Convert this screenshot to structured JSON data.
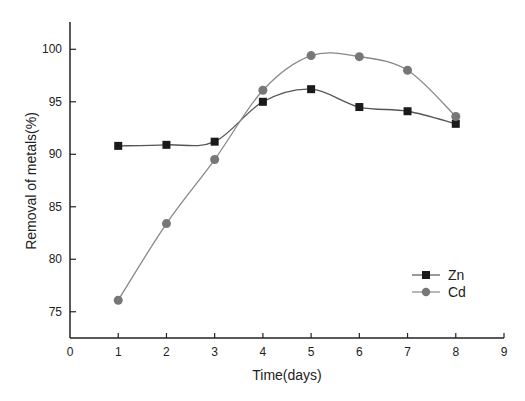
{
  "chart_data": {
    "type": "line",
    "title": "",
    "xlabel": "Time(days)",
    "ylabel": "Removal of metals(%)",
    "xlim": [
      0,
      9
    ],
    "ylim": [
      72.5,
      102.6
    ],
    "x_ticks": [
      0,
      1,
      2,
      3,
      4,
      5,
      6,
      7,
      8,
      9
    ],
    "y_ticks": [
      75,
      80,
      85,
      90,
      95,
      100
    ],
    "grid": false,
    "legend_position": "lower right",
    "x": [
      1,
      2,
      3,
      4,
      5,
      6,
      7,
      8
    ],
    "series": [
      {
        "name": "Zn",
        "marker": "square",
        "color": "#1a1a1a",
        "line_color": "#555555",
        "values": [
          90.8,
          90.9,
          91.2,
          95.0,
          96.2,
          94.5,
          94.1,
          92.9
        ]
      },
      {
        "name": "Cd",
        "marker": "circle",
        "color": "#777777",
        "line_color": "#888888",
        "values": [
          76.1,
          83.4,
          89.5,
          96.1,
          99.4,
          99.3,
          98.0,
          93.6
        ]
      }
    ]
  },
  "legend": {
    "items": [
      {
        "label": "Zn"
      },
      {
        "label": "Cd"
      }
    ]
  },
  "axes": {
    "x_title": "Time(days)",
    "y_title": "Removal of metals(%)"
  }
}
